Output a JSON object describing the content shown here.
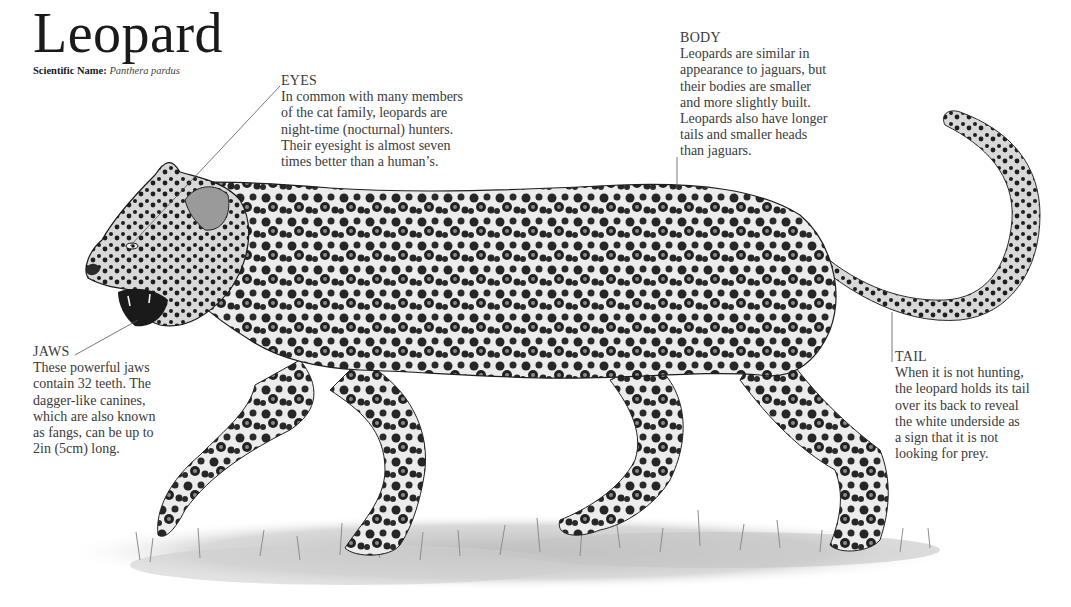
{
  "title": "Leopard",
  "scientific_name": {
    "label": "Scientific Name:",
    "value": "Panthera pardus"
  },
  "annotations": [
    {
      "id": "eyes",
      "heading": "EYES",
      "text": "In common with many members\nof the cat family, leopards are\nnight-time (nocturnal) hunters.\nTheir eyesight is almost seven\ntimes better than a human’s."
    },
    {
      "id": "body",
      "heading": "BODY",
      "text": "Leopards are similar in\nappearance to jaguars, but\ntheir bodies are smaller\nand more slightly built.\nLeopards also have longer\ntails and smaller heads\nthan jaguars."
    },
    {
      "id": "jaws",
      "heading": "JAWS",
      "text": "These powerful jaws\ncontain 32 teeth. The\ndagger-like canines,\nwhich are also known\nas fangs, can be up to\n2in (5cm) long."
    },
    {
      "id": "tail",
      "heading": "TAIL",
      "text": "When it is not hunting,\nthe leopard holds its tail\nover its back to reveal\nthe white underside as\na sign that it is not\nlooking for prey."
    }
  ],
  "illustration": {
    "subject": "leopard-walking-side-view",
    "style": "monochrome pencil illustration",
    "colors": {
      "fur": "#e8e8e8",
      "spots": "#1c1c1c",
      "ground": "#c8c8c8",
      "leader_line": "#555555"
    }
  }
}
